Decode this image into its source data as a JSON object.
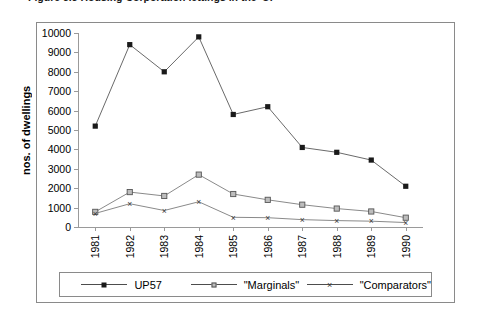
{
  "caption": "Figure 5.3   Housing Corporation lettings in the 'UP'",
  "axis": {
    "ylabel": "nos. of dwellings",
    "yticks": [
      0,
      1000,
      2000,
      3000,
      4000,
      5000,
      6000,
      7000,
      8000,
      9000,
      10000
    ]
  },
  "legend": [
    {
      "name": "legend-up57",
      "label": "UP57",
      "marker": "filled-square",
      "color": "#1a1a1a"
    },
    {
      "name": "legend-marginals",
      "label": "\"Marginals\"",
      "marker": "open-square",
      "color": "#7a7a7a"
    },
    {
      "name": "legend-comparators",
      "label": "\"Comparators\"",
      "marker": "x",
      "color": "#3a3a3a"
    }
  ],
  "chart_data": {
    "type": "line",
    "title": "Figure 5.3   Housing Corporation lettings in the 'UP'",
    "xlabel": "",
    "ylabel": "nos. of dwellings",
    "categories": [
      "1981",
      "1982",
      "1983",
      "1984",
      "1985",
      "1986",
      "1987",
      "1988",
      "1989",
      "1990"
    ],
    "ylim": [
      0,
      10000
    ],
    "ytick_step": 1000,
    "grid": false,
    "legend_position": "bottom",
    "series": [
      {
        "name": "UP57",
        "marker": "filled-square",
        "color": "#1a1a1a",
        "values": [
          5200,
          9400,
          8000,
          9800,
          5800,
          6200,
          4100,
          3850,
          3450,
          2100
        ]
      },
      {
        "name": "\"Marginals\"",
        "marker": "open-square",
        "color": "#7a7a7a",
        "values": [
          780,
          1800,
          1600,
          2700,
          1700,
          1400,
          1150,
          950,
          800,
          480
        ]
      },
      {
        "name": "\"Comparators\"",
        "marker": "x",
        "color": "#3a3a3a",
        "values": [
          700,
          1200,
          850,
          1300,
          500,
          480,
          380,
          330,
          300,
          230
        ]
      }
    ]
  }
}
